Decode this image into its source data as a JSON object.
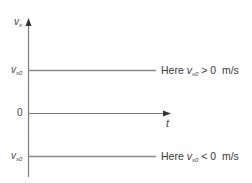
{
  "diagram": {
    "title": "",
    "y_axis": {
      "label_main": "v",
      "label_sub": "x"
    },
    "x_axis": {
      "label": "t"
    },
    "ticks": [
      {
        "id": "top",
        "main": "v",
        "sub": "x0"
      },
      {
        "id": "zero",
        "text": "0"
      },
      {
        "id": "bottom",
        "main": "v",
        "sub": "x0"
      }
    ],
    "annotations": [
      {
        "id": "positive",
        "prefix": "Here ",
        "var_main": "v",
        "var_sub": "x0",
        "suffix": " > 0  m/s"
      },
      {
        "id": "negative",
        "prefix": "Here ",
        "var_main": "v",
        "var_sub": "x0",
        "suffix": " < 0  m/s"
      }
    ],
    "colors": {
      "axis": "#7a7a7a",
      "line": "#8a8a8a",
      "text": "#3a3a3a"
    }
  }
}
